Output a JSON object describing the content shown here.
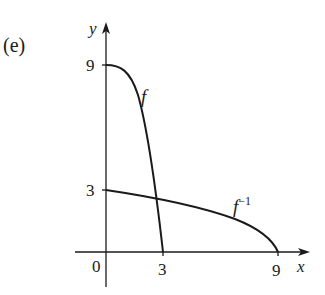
{
  "figure": {
    "part_label": "(e)",
    "axes": {
      "x_label": "x",
      "y_label": "y",
      "origin_label": "0",
      "x_ticks": [
        "3",
        "9"
      ],
      "y_ticks": [
        "9",
        "3"
      ]
    },
    "curves": [
      {
        "name": "f",
        "label": "f",
        "description": "decreasing concave-down curve from (0,9) to (3,0)"
      },
      {
        "name": "f_inverse",
        "label": "f",
        "superscript": "−1",
        "description": "decreasing curve from (0,3) to (9,0)"
      }
    ],
    "colors": {
      "ink": "#1a1a1a",
      "background": "#ffffff"
    }
  }
}
